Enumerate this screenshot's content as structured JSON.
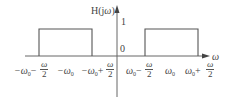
{
  "diagram": {
    "y_label_prefix": "H(j",
    "y_label_var": "ω",
    "y_label_suffix": ")",
    "x_label": "ω",
    "origin_label": "0",
    "level_label": "1",
    "tick_labels": [
      {
        "main": "−ω",
        "sub": "0",
        "op": "−",
        "num": "ω",
        "den": "2"
      },
      {
        "main": "−ω",
        "sub": "0"
      },
      {
        "main": "−ω",
        "sub": "0",
        "op": "+",
        "num": "ω",
        "den": "2"
      },
      {
        "main": "ω",
        "sub": "0",
        "op": "−",
        "num": "ω",
        "den": "2"
      },
      {
        "main": "ω",
        "sub": "0"
      },
      {
        "main": "ω",
        "sub": "0",
        "op": "+",
        "num": "ω",
        "den": "2"
      }
    ],
    "colors": {
      "line": "#555555",
      "text": "#444444"
    }
  }
}
